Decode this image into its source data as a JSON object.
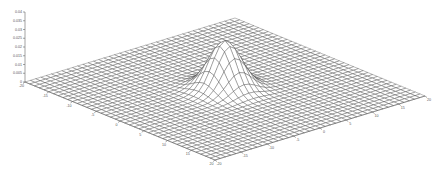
{
  "chart_data": {
    "type": "surface",
    "title": "",
    "xlabel": "",
    "ylabel": "",
    "zlabel": "",
    "x_range": [
      -20,
      20
    ],
    "y_range": [
      -20,
      20
    ],
    "zlim": [
      0,
      0.04
    ],
    "grid": false,
    "mesh_resolution": 41,
    "function": "z = exp(-(x^2+y^2)/(2*sigma^2)) / (2*pi*sigma^2)",
    "sigma": 2.4,
    "peak": {
      "x": 0,
      "y": 0,
      "z": 0.0276
    },
    "x_ticks": [
      "-20",
      "-15",
      "-10",
      "-5",
      "0",
      "5",
      "10",
      "15",
      "20"
    ],
    "y_ticks": [
      "-20",
      "-15",
      "-10",
      "-5",
      "0",
      "5",
      "10",
      "15",
      "20"
    ],
    "z_ticks": [
      "0",
      "0.005",
      "0.01",
      "0.015",
      "0.02",
      "0.025",
      "0.03",
      "0.035",
      "0.04"
    ],
    "colors": {
      "mesh_line": "#3a3a3a",
      "face": "#ffffff",
      "axis": "#666666",
      "tick_text": "#555555"
    }
  }
}
